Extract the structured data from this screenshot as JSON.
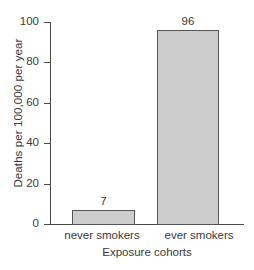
{
  "chart_data": {
    "type": "bar",
    "title": "",
    "subtitle": "",
    "categories": [
      "never smokers",
      "ever smokers"
    ],
    "values": [
      7,
      96
    ],
    "data_labels": [
      "7",
      "96"
    ],
    "xlabel": "Exposure cohorts",
    "ylabel": "Deaths per 100,000 per year",
    "ylim": [
      0,
      100
    ],
    "ytick_values": [
      0,
      20,
      40,
      60,
      80,
      100
    ],
    "ytick_labels": [
      "0",
      "20",
      "40",
      "60",
      "80",
      "100"
    ],
    "grid": false,
    "legend": null,
    "legend_position": "none",
    "bar_fill_color": "#cdcdcd",
    "bar_border_color": "#565656",
    "axis_color": "#4a4a4a",
    "text_color": "#3a3a3a",
    "background_color": "#ffffff"
  }
}
